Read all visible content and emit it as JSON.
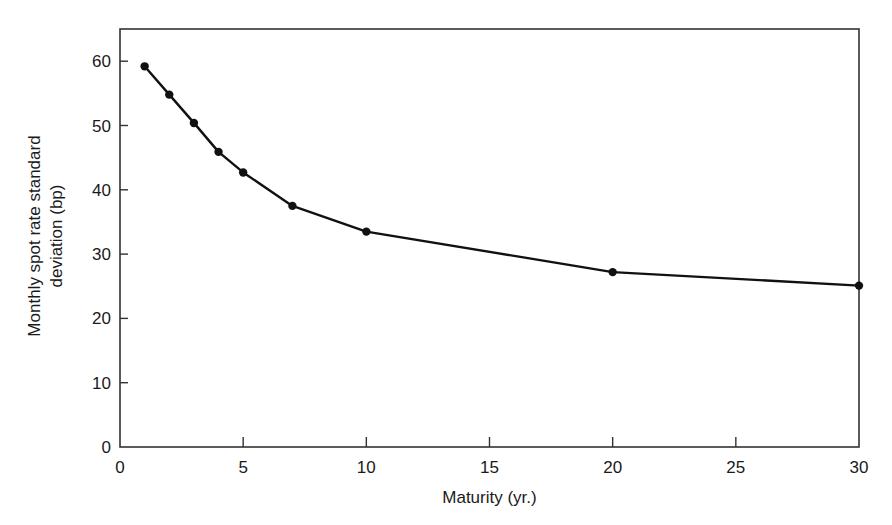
{
  "chart_data": {
    "type": "line",
    "title": "",
    "xlabel": "Maturity (yr.)",
    "ylabel_lines": [
      "Monthly spot rate standard",
      "deviation (bp)"
    ],
    "ylabel": "Monthly spot rate standard deviation (bp)",
    "xlim": [
      0,
      30
    ],
    "ylim": [
      0,
      65
    ],
    "xticks": [
      0,
      5,
      10,
      15,
      20,
      25,
      30
    ],
    "yticks": [
      0,
      10,
      20,
      30,
      40,
      50,
      60
    ],
    "grid": false,
    "legend": null,
    "series": [
      {
        "name": "Monthly spot rate standard deviation",
        "marker": "circle",
        "color": "#111111",
        "x": [
          1,
          2,
          3,
          4,
          5,
          7,
          10,
          20,
          30
        ],
        "y": [
          59.2,
          54.8,
          50.4,
          45.9,
          42.7,
          37.5,
          33.5,
          27.2,
          25.1
        ]
      }
    ]
  },
  "colors": {
    "line": "#111111",
    "axis": "#333333",
    "background": "#ffffff"
  }
}
